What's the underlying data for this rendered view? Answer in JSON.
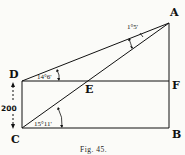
{
  "figure": {
    "caption": "Fig. 45.",
    "points": {
      "A": "A",
      "B": "B",
      "C": "C",
      "D": "D",
      "E": "E",
      "F": "F"
    },
    "angles": {
      "at_A": "1°5'",
      "at_D": "14°6'",
      "at_C": "15°11'"
    },
    "dimension": {
      "DC": "200"
    },
    "lines": [
      "DA",
      "CA",
      "DF",
      "CB",
      "AB",
      "DC"
    ],
    "colors": {
      "ink": "#111111",
      "paper": "#fbfbf8"
    }
  }
}
